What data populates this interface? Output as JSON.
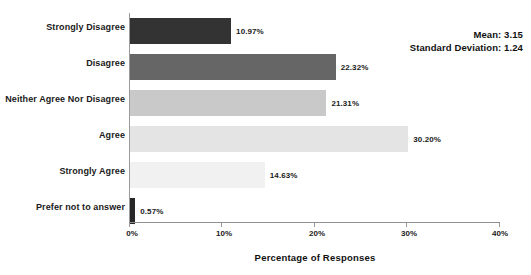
{
  "chart_data": {
    "type": "bar",
    "orientation": "horizontal",
    "title": "",
    "xlabel": "Percentage of Responses",
    "ylabel": "",
    "xlim": [
      0,
      40
    ],
    "grid": false,
    "legend": null,
    "categories": [
      "Strongly Disagree",
      "Disagree",
      "Neither Agree Nor Disagree",
      "Agree",
      "Strongly Agree",
      "Prefer not to answer"
    ],
    "values": [
      10.97,
      22.32,
      21.31,
      30.2,
      14.63,
      0.57
    ],
    "value_labels": [
      "10.97%",
      "22.32%",
      "21.31%",
      "30.20%",
      "14.63%",
      "0.57%"
    ],
    "bar_colors": [
      "#333333",
      "#666666",
      "#c9c9c9",
      "#e4e4e4",
      "#f1f1f1",
      "#262626"
    ],
    "xticks": [
      0,
      10,
      20,
      30,
      40
    ],
    "xtick_labels": [
      "0%",
      "10%",
      "20%",
      "30%",
      "40%"
    ],
    "annotations": {
      "mean": "Mean: 3.15",
      "std_dev": "Standard Deviation: 1.24"
    }
  }
}
